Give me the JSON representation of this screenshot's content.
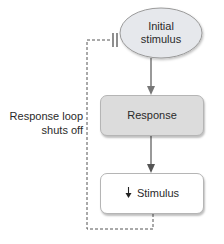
{
  "diagram": {
    "nodes": {
      "initial_stimulus": {
        "label_line1": "Initial",
        "label_line2": "stimulus",
        "shape": "ellipse"
      },
      "response": {
        "label": "Response",
        "shape": "rounded-rect"
      },
      "stimulus": {
        "label": "Stimulus",
        "prefix_icon": "down-arrow-icon",
        "shape": "rounded-rect"
      }
    },
    "feedback_loop": {
      "label_line1": "Response loop",
      "label_line2": "shuts off",
      "style": "dashed",
      "terminator": "double-bar-inhibition"
    },
    "edges": [
      {
        "from": "initial_stimulus",
        "to": "response"
      },
      {
        "from": "response",
        "to": "stimulus"
      },
      {
        "from": "stimulus",
        "to": "initial_stimulus",
        "type": "negative-feedback"
      }
    ]
  },
  "colors": {
    "ellipse_fill": "#e6e8ec",
    "response_fill": "#dcdcdc",
    "stimulus_fill": "#ffffff",
    "border": "#9a9a9a",
    "arrow": "#555555",
    "dashed_line": "#555555"
  }
}
